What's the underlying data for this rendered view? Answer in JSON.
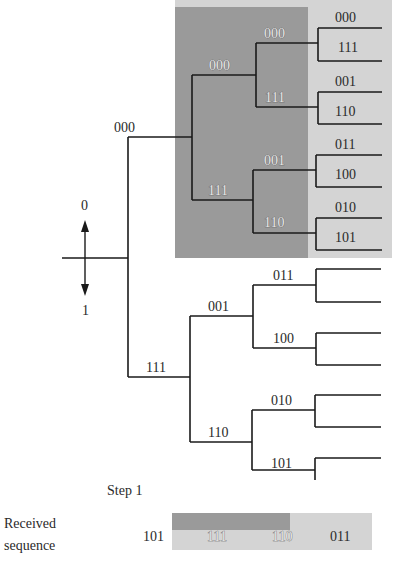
{
  "colors": {
    "dark_region": "#9a9a9a",
    "light_region": "#d4d4d4",
    "line": "#1a1a1a"
  },
  "direction_indicator": {
    "up_label": "0",
    "down_label": "1"
  },
  "tree": {
    "level1": {
      "upper": "000",
      "lower": "111"
    },
    "level2": {
      "upper_upper": "000",
      "upper_lower": "111",
      "lower_upper": "001",
      "lower_lower": "110"
    },
    "level3": [
      "000",
      "111",
      "001",
      "110",
      "011",
      "100",
      "010",
      "101",
      "011",
      "100",
      "010",
      "101"
    ],
    "level3_upper": [
      "000",
      "111",
      "001",
      "110",
      "011",
      "100",
      "010",
      "101"
    ],
    "level3_lower": [
      "011",
      "100",
      "010",
      "101"
    ]
  },
  "lower_subtree": {
    "level2_upper": "001",
    "level2_lower": "110",
    "level3": [
      "011",
      "100",
      "010",
      "101"
    ]
  },
  "step_label": "Step 1",
  "received": {
    "label_line1": "Received",
    "label_line2": "sequence",
    "symbols": [
      "101",
      "111",
      "110",
      "011"
    ]
  }
}
